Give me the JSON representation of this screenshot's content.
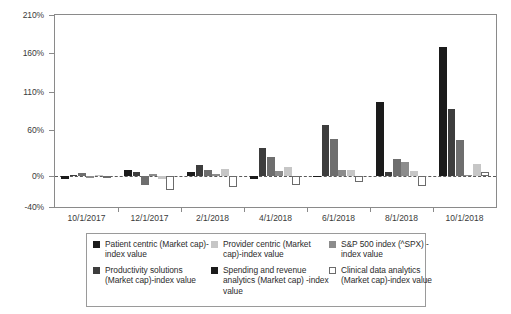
{
  "chart_data": {
    "type": "bar",
    "title": "",
    "xlabel": "",
    "ylabel": "",
    "grid": false,
    "legend_position": "bottom",
    "ylim": [
      -40,
      210
    ],
    "ytick_labels": [
      "210%",
      "160%",
      "110%",
      "60%",
      "0%",
      "-40%"
    ],
    "ytick_values": [
      210,
      160,
      110,
      60,
      0,
      -40
    ],
    "zero_reference_line": true,
    "categories": [
      "10/1/2017",
      "12/1/2017",
      "2/1/2018",
      "4/1/2018",
      "6/1/2018",
      "8/1/2018",
      "10/1/2018"
    ],
    "series": [
      {
        "name": "Patient centric (Market cap)-index value",
        "color": "#1b1b1b",
        "values": [
          -3,
          8,
          5,
          -3,
          1,
          97,
          168
        ]
      },
      {
        "name": "Productivity solutions (Market cap)-index value",
        "color": "#3d3d3d",
        "values": [
          2,
          5,
          15,
          37,
          67,
          5,
          88
        ]
      },
      {
        "name": "Provider centric (Market cap)-index value",
        "color": "#c6c6c6",
        "values": [
          4,
          -12,
          8,
          25,
          48,
          22,
          47
        ]
      },
      {
        "name": "Spending and revenue analytics (Market cap)-index value",
        "color": "#1b1b1b",
        "values": [
          -2,
          3,
          3,
          7,
          8,
          18,
          2
        ]
      },
      {
        "name": "S&P 500 index (^SPX)-index value",
        "color": "#8c8c8c",
        "values": [
          2,
          -3,
          10,
          12,
          8,
          7,
          16
        ]
      },
      {
        "name": "Clinical data analytics (Market cap)-index value",
        "color": "#ffffff",
        "values": [
          -1,
          -18,
          -14,
          -12,
          -8,
          -13,
          5
        ]
      }
    ]
  },
  "legend": {
    "entries": [
      "Patient centric (Market cap)-index value",
      "Productivity solutions (Market cap)-index value",
      "Provider centric (Market cap)-index value",
      "Spending and revenue analytics (Market cap) -index value",
      "S&P 500 index (^SPX) -index value",
      "Clinical data analytics (Market cap)-index value"
    ]
  }
}
